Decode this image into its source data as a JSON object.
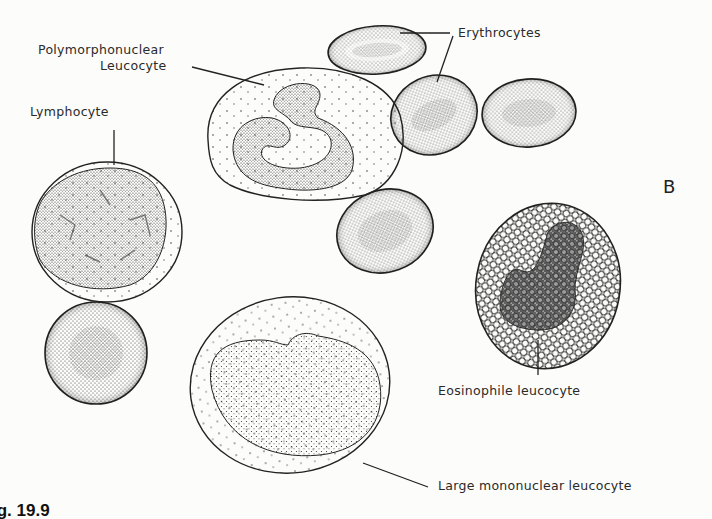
{
  "figure": {
    "panel_letter": "B",
    "figure_number": "ig. 19.9",
    "labels": {
      "polymorphonuclear_line1": "Polymorphonuclear",
      "polymorphonuclear_line2": "Leucocyte",
      "erythrocytes": "Erythrocytes",
      "lymphocyte": "Lymphocyte",
      "eosinophile": "Eosinophile leucocyte",
      "large_mononuclear": "Large mononuclear leucocyte"
    },
    "cells": [
      {
        "type": "erythrocyte",
        "count": 5
      },
      {
        "type": "polymorphonuclear-leucocyte",
        "count": 1
      },
      {
        "type": "lymphocyte",
        "count": 1
      },
      {
        "type": "eosinophile-leucocyte",
        "count": 1
      },
      {
        "type": "large-mononuclear-leucocyte",
        "count": 1
      }
    ],
    "colors": {
      "ink": "#2a2a2a",
      "paper": "#fcfcfa"
    }
  }
}
